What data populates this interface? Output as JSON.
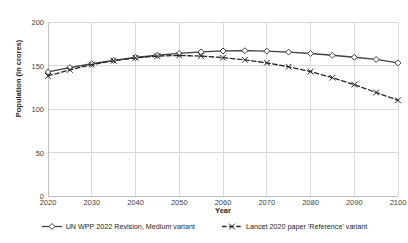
{
  "chart_data": {
    "type": "line",
    "title": "",
    "xlabel": "Year",
    "ylabel": "Population (in crores)",
    "xlim": [
      2020,
      2100
    ],
    "ylim": [
      0,
      200
    ],
    "ytick_values": [
      0,
      50,
      100,
      150,
      200
    ],
    "ytick_labels": [
      "0",
      "50",
      "100",
      "150",
      "200"
    ],
    "xtick_values": [
      2020,
      2030,
      2040,
      2050,
      2060,
      2070,
      2080,
      2090,
      2100
    ],
    "xtick_labels": [
      "2020",
      "2030",
      "2040",
      "2050",
      "2060",
      "2070",
      "2080",
      "2090",
      "2100"
    ],
    "grid": "horizontal-and-vertical",
    "legend_position": "bottom",
    "x": [
      2020,
      2025,
      2030,
      2035,
      2040,
      2045,
      2050,
      2055,
      2060,
      2065,
      2070,
      2075,
      2080,
      2085,
      2090,
      2095,
      2100
    ],
    "series": [
      {
        "name": "UN WPP 2022 Revision, Medium variant",
        "marker": "open-diamond",
        "line_style": "solid",
        "color": "#404040",
        "values": [
          142.6,
          147.6,
          152.0,
          155.9,
          159.2,
          161.8,
          163.9,
          165.6,
          166.7,
          167.0,
          166.6,
          165.4,
          163.8,
          161.8,
          159.5,
          157.0,
          153.0
        ]
      },
      {
        "name": "Lancet 2020 paper 'Reference' variant",
        "marker": "x",
        "line_style": "dashed",
        "color": "#262626",
        "values": [
          138.0,
          145.0,
          151.0,
          155.5,
          158.8,
          160.8,
          161.5,
          160.8,
          159.0,
          156.5,
          153.0,
          148.5,
          143.0,
          136.0,
          128.0,
          119.0,
          110.0
        ]
      }
    ]
  },
  "legend": {
    "items": [
      {
        "label": "UN WPP 2022 Revision, Medium variant"
      },
      {
        "label": "Lancet 2020 paper 'Reference' variant"
      }
    ]
  },
  "colors": {
    "series1": "#404040",
    "series2": "#262626",
    "grid": "#d9d9d9",
    "axis": "#bfbfbf",
    "text": "#262626"
  }
}
